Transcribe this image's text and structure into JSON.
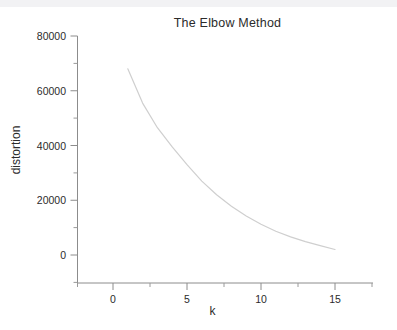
{
  "figure": {
    "title": "The Elbow Method",
    "background_color": "#ffffff",
    "top_strip_color": "#f2f2f4"
  },
  "chart_data": {
    "type": "line",
    "title": "The Elbow Method",
    "xlabel": "k",
    "ylabel": "distortion",
    "xlim": [
      -2.5,
      17.2
    ],
    "ylim": [
      -18000,
      80000
    ],
    "grid": false,
    "legend": null,
    "axis_color": "#8c8c8c",
    "line_color": "#cfcfcf",
    "line_width": 1,
    "x_ticks": [
      0,
      5,
      10,
      15
    ],
    "x_tick_labels": [
      "0",
      "5",
      "10",
      "15"
    ],
    "x_minor_ticks": [
      -2.5,
      2.5,
      7.5,
      12.5,
      17.2
    ],
    "y_ticks": [
      0,
      20000,
      40000,
      60000,
      80000
    ],
    "y_tick_labels": [
      "0",
      "20000",
      "40000",
      "60000",
      "80000"
    ],
    "y_minor_ticks": [
      10000,
      30000,
      50000,
      70000
    ],
    "x": [
      1,
      2,
      3,
      4,
      5,
      6,
      7,
      8,
      9,
      10,
      11,
      12,
      13,
      14,
      15
    ],
    "values": [
      68000,
      55500,
      46500,
      39500,
      33000,
      27000,
      22000,
      17800,
      14200,
      11200,
      8700,
      6600,
      4900,
      3400,
      2000
    ],
    "series": [
      {
        "name": "distortion",
        "values": [
          68000,
          55500,
          46500,
          39500,
          33000,
          27000,
          22000,
          17800,
          14200,
          11200,
          8700,
          6600,
          4900,
          3400,
          2000
        ]
      }
    ]
  }
}
